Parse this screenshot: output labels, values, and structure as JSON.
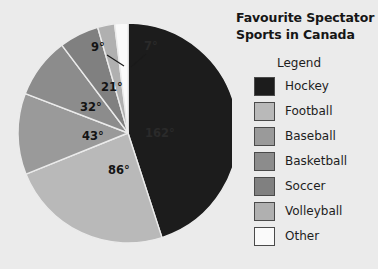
{
  "background_color": "#ebebeb",
  "header": {
    "title_line1": "Favourite Spectator",
    "title_line2": "Sports in Canada",
    "title_full": "Favourite Spectator Sports in Canada"
  },
  "legend": {
    "heading": "Legend",
    "items": [
      {
        "label": "Hockey",
        "color": "#1c1c1c"
      },
      {
        "label": "Football",
        "color": "#b9b9b9"
      },
      {
        "label": "Baseball",
        "color": "#9a9a9a"
      },
      {
        "label": "Basketball",
        "color": "#8c8c8c"
      },
      {
        "label": "Soccer",
        "color": "#808080"
      },
      {
        "label": "Volleyball",
        "color": "#b0b0b0"
      },
      {
        "label": "Other",
        "color": "#fafafa"
      }
    ]
  },
  "chart_data": {
    "type": "pie",
    "title": "Favourite Spectator Sports in Canada",
    "value_unit": "degrees",
    "total_degrees": 360,
    "legend_position": "right",
    "start_angle_deg": 0,
    "direction": "clockwise",
    "categories": [
      "Hockey",
      "Football",
      "Baseball",
      "Basketball",
      "Soccer",
      "Volleyball",
      "Other"
    ],
    "values": [
      162,
      86,
      43,
      32,
      21,
      9,
      7
    ],
    "colors": [
      "#1c1c1c",
      "#b9b9b9",
      "#9a9a9a",
      "#8c8c8c",
      "#808080",
      "#b0b0b0",
      "#fafafa"
    ],
    "slices": [
      {
        "label": "Hockey",
        "degrees": 162,
        "display": "162°",
        "color": "#1c1c1c",
        "label_x": 160,
        "label_y": 137,
        "label_anchor": "middle",
        "on_dark": true,
        "leader": false
      },
      {
        "label": "Football",
        "degrees": 86,
        "display": "86°",
        "color": "#b9b9b9",
        "label_x": 119,
        "label_y": 174,
        "label_anchor": "middle",
        "on_dark": false,
        "leader": false
      },
      {
        "label": "Baseball",
        "degrees": 43,
        "display": "43°",
        "color": "#9a9a9a",
        "label_x": 93,
        "label_y": 140,
        "label_anchor": "middle",
        "on_dark": false,
        "leader": false
      },
      {
        "label": "Basketball",
        "degrees": 32,
        "display": "32°",
        "color": "#8c8c8c",
        "label_x": 91,
        "label_y": 111,
        "label_anchor": "middle",
        "on_dark": false,
        "leader": false
      },
      {
        "label": "Soccer",
        "degrees": 21,
        "display": "21°",
        "color": "#808080",
        "label_x": 112,
        "label_y": 91,
        "label_anchor": "middle",
        "on_dark": false,
        "leader": false
      },
      {
        "label": "Volleyball",
        "degrees": 9,
        "display": "9°",
        "color": "#b0b0b0",
        "label_x": 98,
        "label_y": 51,
        "label_anchor": "middle",
        "on_dark": false,
        "leader": true,
        "leader_path": "M 107 55 L 124 66"
      },
      {
        "label": "Other",
        "degrees": 7,
        "display": "7°",
        "color": "#fafafa",
        "label_x": 151,
        "label_y": 50,
        "label_anchor": "middle",
        "on_dark": true,
        "leader": true,
        "leader_path": "M 146 54 L 131 67"
      }
    ],
    "geometry": {
      "cx": 128,
      "cy": 133,
      "r": 110
    }
  }
}
